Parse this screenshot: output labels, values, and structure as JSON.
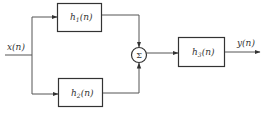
{
  "diagram": {
    "type": "block-diagram",
    "input": {
      "label": "x(n)"
    },
    "output": {
      "label": "y(n)"
    },
    "blocks": [
      {
        "id": "h1",
        "name": "h",
        "sub": "1",
        "suffix": "(n)"
      },
      {
        "id": "h2",
        "name": "h",
        "sub": "2",
        "suffix": "(n)"
      },
      {
        "id": "h3",
        "name": "h",
        "sub": "3",
        "suffix": "(n)"
      }
    ],
    "summer": {
      "symbol": "Σ"
    },
    "colors": {
      "line": "#555555",
      "text": "#333333",
      "background": "#ffffff"
    }
  }
}
